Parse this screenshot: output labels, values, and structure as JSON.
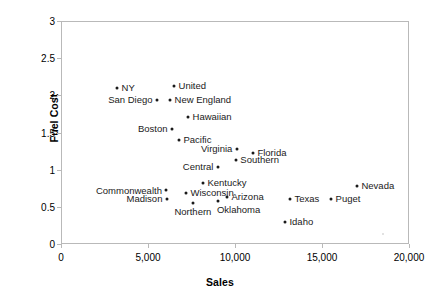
{
  "chart_data": {
    "type": "scatter",
    "title": "",
    "xlabel": "Sales",
    "ylabel": "Fuel Cost",
    "xlim": [
      0,
      20000
    ],
    "ylim": [
      0,
      3
    ],
    "xticks": [
      0,
      5000,
      10000,
      15000,
      20000
    ],
    "xtick_labels": [
      "0",
      "5,000",
      "10,000",
      "15,000",
      "20,000"
    ],
    "yticks": [
      0,
      0.5,
      1,
      1.5,
      2,
      2.5,
      3
    ],
    "ytick_labels": [
      "0",
      "0.5",
      "1",
      "1.5",
      "2",
      "2.5",
      "3"
    ],
    "grid": false,
    "legend": "none",
    "marker_color": "#1a1a1a",
    "frame_color": "#b9b9b9",
    "points": [
      {
        "label": "NY",
        "x": 3220,
        "y": 2.1,
        "label_pos": "right"
      },
      {
        "label": "United",
        "x": 6500,
        "y": 2.13,
        "label_pos": "right"
      },
      {
        "label": "San Diego",
        "x": 5520,
        "y": 1.94,
        "label_pos": "left"
      },
      {
        "label": "New England",
        "x": 6270,
        "y": 1.94,
        "label_pos": "right"
      },
      {
        "label": "Hawaiian",
        "x": 7300,
        "y": 1.71,
        "label_pos": "right"
      },
      {
        "label": "Boston",
        "x": 6380,
        "y": 1.55,
        "label_pos": "left"
      },
      {
        "label": "Pacific",
        "x": 6780,
        "y": 1.4,
        "label_pos": "right"
      },
      {
        "label": "Virginia",
        "x": 10110,
        "y": 1.28,
        "label_pos": "left"
      },
      {
        "label": "Florida",
        "x": 11030,
        "y": 1.22,
        "label_pos": "right"
      },
      {
        "label": "Southern",
        "x": 10050,
        "y": 1.13,
        "label_pos": "right"
      },
      {
        "label": "Central",
        "x": 9020,
        "y": 1.04,
        "label_pos": "left"
      },
      {
        "label": "Kentucky",
        "x": 8160,
        "y": 0.82,
        "label_pos": "right"
      },
      {
        "label": "Commonwealth",
        "x": 6030,
        "y": 0.73,
        "label_pos": "wrapped-left"
      },
      {
        "label": "Wisconsin",
        "x": 7180,
        "y": 0.69,
        "label_pos": "right"
      },
      {
        "label": "Madison",
        "x": 6090,
        "y": 0.61,
        "label_pos": "left"
      },
      {
        "label": "Northern",
        "x": 7580,
        "y": 0.55,
        "label_pos": "below"
      },
      {
        "label": "Arizona",
        "x": 9540,
        "y": 0.63,
        "label_pos": "right"
      },
      {
        "label": "Oklahoma",
        "x": 9020,
        "y": 0.58,
        "label_pos": "below-right"
      },
      {
        "label": "Nevada",
        "x": 17010,
        "y": 0.78,
        "label_pos": "right"
      },
      {
        "label": "Texas",
        "x": 13160,
        "y": 0.61,
        "label_pos": "right"
      },
      {
        "label": "Puget",
        "x": 15520,
        "y": 0.61,
        "label_pos": "right"
      },
      {
        "label": "Idaho",
        "x": 12870,
        "y": 0.3,
        "label_pos": "right"
      }
    ]
  }
}
